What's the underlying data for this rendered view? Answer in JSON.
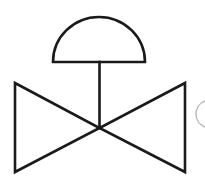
{
  "canvas": {
    "width": 205,
    "height": 191,
    "background_color": "#ffffff",
    "title": "Diaphragm-actuated valve symbol"
  },
  "style": {
    "line_color": "#1a1a1a",
    "line_width": 2.6,
    "faint_line_color": "#b9b9b9",
    "faint_line_width": 1.5
  },
  "diagram": {
    "type": "pid-symbol",
    "name": "diaphragm-actuated-globe-valve",
    "elements": [
      {
        "id": "actuator-dome",
        "label": "Diaphragm actuator",
        "shape": "semicircle",
        "center_x": 99,
        "baseline_y": 62,
        "radius_x": 46,
        "radius_y": 45,
        "left_x": 53,
        "right_x": 145,
        "apex_y": 17
      },
      {
        "id": "valve-stem",
        "label": "Valve stem",
        "shape": "line",
        "x1": 99.5,
        "y1": 62,
        "x2": 99.5,
        "y2": 128
      },
      {
        "id": "body-left-triangle",
        "label": "Left valve body triangle",
        "shape": "polygon",
        "points": "15,83 15,172 99.5,128"
      },
      {
        "id": "body-right-triangle",
        "label": "Right valve body triangle",
        "shape": "polygon",
        "points": "185,83 185,172 99.5,128"
      },
      {
        "id": "cropped-circle-arc",
        "label": "Partial circle at right edge",
        "shape": "arc",
        "center_x": 210,
        "center_y": 114,
        "radius": 14,
        "top_y": 101,
        "bottom_y": 127
      }
    ]
  }
}
